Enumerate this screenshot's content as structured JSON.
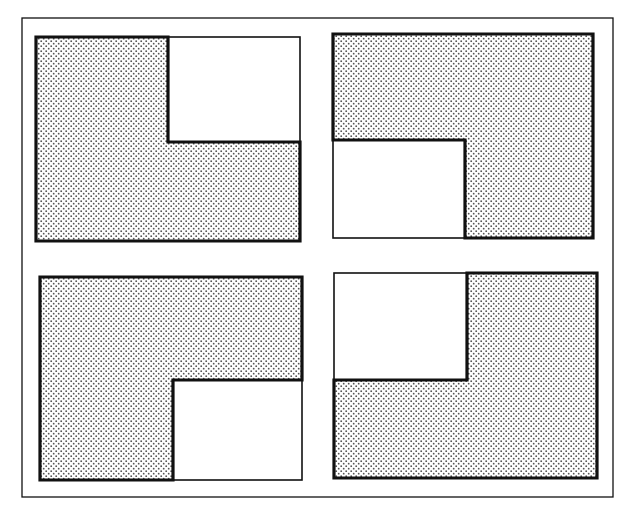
{
  "figure": {
    "colors": {
      "background": "#ffffff",
      "stroke": "#111111",
      "stipple_dot": "#555555"
    },
    "outer_frame": {
      "x1": 22,
      "y1": 18,
      "x2": 613,
      "y2": 497
    },
    "panels": [
      {
        "id": "top-left",
        "empty_quadrant": "top-right",
        "rect": {
          "x1": 36,
          "y1": 37,
          "x2": 300,
          "y2": 241
        },
        "notch": {
          "x": 168,
          "y": 142
        }
      },
      {
        "id": "top-right",
        "empty_quadrant": "bottom-left",
        "rect": {
          "x1": 333,
          "y1": 34,
          "x2": 593,
          "y2": 238
        },
        "notch": {
          "x": 465,
          "y": 140
        }
      },
      {
        "id": "bottom-left",
        "empty_quadrant": "bottom-right",
        "rect": {
          "x1": 40,
          "y1": 277,
          "x2": 302,
          "y2": 480
        },
        "notch": {
          "x": 173,
          "y": 380
        }
      },
      {
        "id": "bottom-right",
        "empty_quadrant": "top-left",
        "rect": {
          "x1": 334,
          "y1": 273,
          "x2": 597,
          "y2": 478
        },
        "notch": {
          "x": 467,
          "y": 380
        }
      }
    ]
  }
}
